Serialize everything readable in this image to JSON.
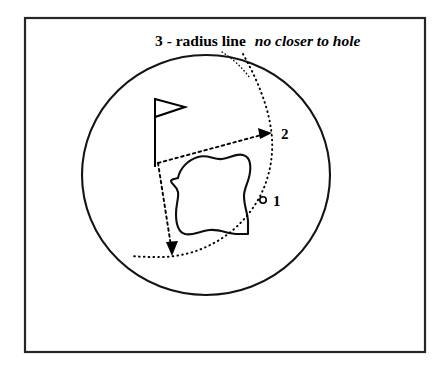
{
  "figure": {
    "kind": "golf-relief-diagram",
    "background_color": "#ffffff",
    "ink_color": "#000000",
    "frame": {
      "name": "outer-frame",
      "x": 25,
      "y": 18,
      "width": 400,
      "height": 334,
      "stroke_color": "#262626"
    }
  },
  "caption": {
    "prefix": "3 - radius line",
    "emphasis": "no closer to hole",
    "full_text": "3 - radius line no closer to hole",
    "x": 155,
    "y": 46
  },
  "green": {
    "name": "putting-green-circle",
    "center_x": 206,
    "center_y": 175,
    "radius_x": 124,
    "radius_y": 120,
    "stroke_color": "#141414"
  },
  "hazard": {
    "name": "hazard-blob",
    "label": "bunker or hazard area",
    "stroke_color": "#0d0d0d"
  },
  "flagstick": {
    "name": "hole-flagstick",
    "pole_x": 155,
    "pole_top_y": 99,
    "pole_bottom_y": 166,
    "flag_tip_x": 184,
    "flag_top_y": 99,
    "flag_bottom_y": 116
  },
  "markers": [
    {
      "id": "1",
      "label": "1",
      "name": "marker-1-ball",
      "description": "original ball position",
      "ball_x": 263,
      "ball_y": 200,
      "ball_radius": 3.2,
      "text_x": 273,
      "text_y": 206
    },
    {
      "id": "2",
      "label": "2",
      "name": "marker-2-relief-point",
      "description": "nearest point of relief along radius",
      "text_x": 281,
      "text_y": 139
    }
  ],
  "radius_arc": {
    "name": "radius-dotted-arc",
    "label": "3 - radius line no closer to hole",
    "style": "dotted",
    "stroke_color": "#000000"
  },
  "relief_lines": [
    {
      "name": "relief-line-upper",
      "style": "dashed",
      "from_x": 158,
      "from_y": 163,
      "to_x": 272,
      "to_y": 133,
      "arrow": "end"
    },
    {
      "name": "relief-line-lower",
      "style": "dashed",
      "from_x": 158,
      "from_y": 163,
      "to_x": 172,
      "to_y": 254,
      "arrow": "end"
    }
  ],
  "leader": {
    "name": "caption-leader-line",
    "style": "dotted",
    "from_x": 222,
    "from_y": 52,
    "to_x": 248,
    "to_y": 75
  }
}
